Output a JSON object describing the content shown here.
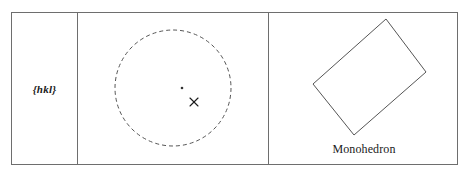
{
  "figure": {
    "type": "crystallographic-form-table",
    "border_color": "#6e6e6e",
    "background": "#ffffff",
    "cells": [
      {
        "name": "form-symbol",
        "label": "{hkl}"
      },
      {
        "name": "stereographic-projection",
        "label": ""
      },
      {
        "name": "crystal-form",
        "label": "Monohedron"
      }
    ]
  },
  "symbol_cell": {
    "text": "{hkl}"
  },
  "projection_cell": {
    "circle": {
      "name": "primitive-circle",
      "style": "dashed",
      "cx": 95,
      "cy": 75,
      "r": 58,
      "stroke": "#555555",
      "dash": "4 3"
    },
    "markers": [
      {
        "name": "pole-upper-dot",
        "glyph": "dot",
        "x": 104,
        "y": 75,
        "size": 2,
        "color": "#333333",
        "meaning": "pole in upper hemisphere"
      },
      {
        "name": "pole-lower-cross",
        "glyph": "×",
        "x": 116,
        "y": 89,
        "size": 9,
        "color": "#1a1a1a",
        "meaning": "pole in lower hemisphere"
      }
    ]
  },
  "form_cell": {
    "label": "Monohedron",
    "shape": {
      "name": "monohedron-face-outline",
      "stroke": "#555555",
      "fill": "none",
      "points": "117,6 157,59 85,122 44,71"
    }
  },
  "colors": {
    "line": "#6e6e6e",
    "stroke": "#555555",
    "text": "#1a1a1a",
    "background": "#ffffff"
  }
}
